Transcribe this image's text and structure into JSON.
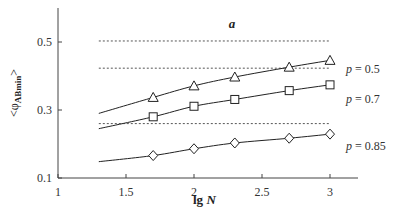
{
  "chart_data": {
    "type": "line",
    "title": "a",
    "xlabel": "lg N",
    "xlabel_parts": {
      "normal": "lg ",
      "italic": "N"
    },
    "ylabel": "<φABmin>",
    "ylabel_parts": {
      "open": "<φ",
      "sub": "ABmin",
      "close": ">"
    },
    "xlim": [
      1,
      3.6
    ],
    "ylim": [
      0.1,
      0.6
    ],
    "xticks": [
      1,
      1.5,
      2,
      2.5,
      3
    ],
    "xtick_labels": [
      "1",
      "1.5",
      "2",
      "2.5",
      "3"
    ],
    "yticks": [
      0.1,
      0.3,
      0.5
    ],
    "ytick_labels": [
      "0.1",
      "0.3",
      "0.5"
    ],
    "grid": false,
    "series": [
      {
        "name": "p = 0.5",
        "label_p": "p",
        "label_value": " = 0.5",
        "marker": "triangle",
        "x": [
          1.7,
          2.0,
          2.3,
          2.7,
          3.0
        ],
        "values": [
          0.337,
          0.371,
          0.397,
          0.426,
          0.446
        ],
        "fit_start": [
          1.3,
          0.29
        ],
        "fit_end": [
          3.0,
          0.456
        ],
        "asymptote": 0.503
      },
      {
        "name": "p = 0.7",
        "label_p": "p",
        "label_value": " = 0.7",
        "marker": "square",
        "x": [
          1.7,
          2.0,
          2.3,
          2.7,
          3.0
        ],
        "values": [
          0.28,
          0.311,
          0.331,
          0.357,
          0.374
        ],
        "fit_start": [
          1.3,
          0.245
        ],
        "fit_end": [
          3.0,
          0.378
        ],
        "asymptote": 0.423
      },
      {
        "name": "p = 0.85",
        "label_p": "p",
        "label_value": " = 0.85",
        "marker": "diamond",
        "x": [
          1.7,
          2.0,
          2.3,
          2.7,
          3.0
        ],
        "values": [
          0.166,
          0.186,
          0.203,
          0.217,
          0.229
        ],
        "fit_start": [
          1.3,
          0.148
        ],
        "fit_end": [
          3.0,
          0.232
        ],
        "asymptote": 0.26
      }
    ],
    "asymptote_x_range": [
      1.3,
      3.0
    ]
  }
}
